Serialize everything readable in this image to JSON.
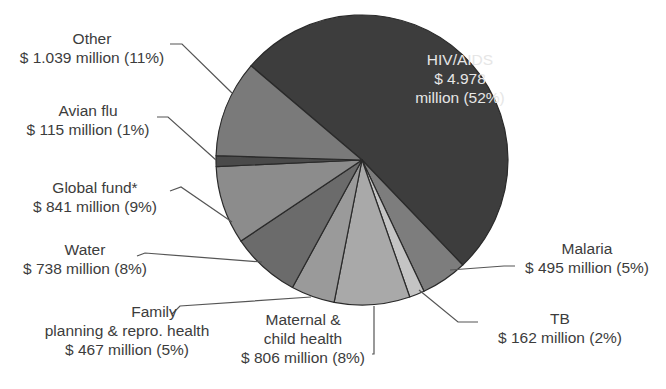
{
  "chart_data": {
    "type": "pie",
    "title": "",
    "unit": "$ million",
    "start_angle_deg": 220.5,
    "direction": "clockwise",
    "center": [
      362,
      160
    ],
    "radius": [
      146,
      145
    ],
    "slices": [
      {
        "key": "hiv",
        "name": "HIV/AIDS",
        "value": 4978,
        "percent": 52,
        "value_text": "$ 4.978",
        "pct_text": "million (52%)",
        "color": "#3d3d3d"
      },
      {
        "key": "malaria",
        "name": "Malaria",
        "value": 495,
        "percent": 5,
        "value_text": "$ 495 million (5%)",
        "color": "#7d7d7d"
      },
      {
        "key": "tb",
        "name": "TB",
        "value": 162,
        "percent": 2,
        "value_text": "$ 162 million (2%)",
        "color": "#c4c4c4"
      },
      {
        "key": "maternal",
        "name": "Maternal & child health",
        "value": 806,
        "percent": 8,
        "value_text": "$ 806 million (8%)",
        "color": "#a9a9a9"
      },
      {
        "key": "family",
        "name": "Family planning & repro. health",
        "value": 467,
        "percent": 5,
        "value_text": "$ 467 million (5%)",
        "color": "#9a9a9a"
      },
      {
        "key": "water",
        "name": "Water",
        "value": 738,
        "percent": 8,
        "value_text": "$ 738 million (8%)",
        "color": "#6b6b6b"
      },
      {
        "key": "global",
        "name": "Global fund*",
        "value": 841,
        "percent": 9,
        "value_text": "$ 841 million (9%)",
        "color": "#8c8c8c"
      },
      {
        "key": "avian",
        "name": "Avian flu",
        "value": 115,
        "percent": 1,
        "value_text": "$ 115 million (1%)",
        "color": "#4a4a4a"
      },
      {
        "key": "other",
        "name": "Other",
        "value": 1039,
        "percent": 11,
        "value_text": "$ 1.039 million (11%)",
        "color": "#7a7a7a"
      }
    ]
  },
  "labels": {
    "hiv": {
      "line1": "HIV/AIDS",
      "line2": "$ 4.978",
      "line3": "million (52%)"
    },
    "other": {
      "line1": "Other",
      "line2": "$ 1.039 million (11%)"
    },
    "avian": {
      "line1": "Avian flu",
      "line2": "$ 115 million (1%)"
    },
    "global": {
      "line1": "Global fund*",
      "line2": "$ 841 million (9%)"
    },
    "water": {
      "line1": "Water",
      "line2": "$ 738 million (8%)"
    },
    "family": {
      "line1": "Family",
      "line2": "planning & repro. health",
      "line3": "$ 467 million (5%)"
    },
    "maternal": {
      "line1": "Maternal &",
      "line2": "child health",
      "line3": "$ 806 million (8%)"
    },
    "tb": {
      "line1": "TB",
      "line2": "$ 162 million (2%)"
    },
    "malaria": {
      "line1": "Malaria",
      "line2": "$ 495 million (5%)"
    }
  }
}
